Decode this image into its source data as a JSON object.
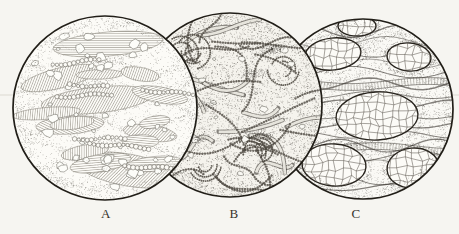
{
  "figure": {
    "kind": "micrograph-plate-illustration",
    "colors": {
      "paper": "#f6f5f1",
      "ink": "#211e18",
      "label_text": "#35322b",
      "rule_line": "#dcd9d1"
    },
    "rule_line_y": 95,
    "panels": [
      {
        "label": "A",
        "texture": "hatched-bands-with-pores",
        "cx": 105,
        "cy": 108,
        "r": 92,
        "z": 2,
        "seed": 1101,
        "label_x": 106,
        "label_y": 207
      },
      {
        "label": "B",
        "texture": "dense-swirl-cells",
        "cx": 230,
        "cy": 105,
        "r": 92,
        "z": 1,
        "seed": 2202,
        "label_x": 234,
        "label_y": 207
      },
      {
        "label": "C",
        "texture": "oval-islands-crackle",
        "cx": 363,
        "cy": 109,
        "r": 90,
        "z": 0,
        "seed": 3303,
        "label_x": 356,
        "label_y": 207,
        "ovals": [
          [
            357,
            26,
            19,
            10,
            0
          ],
          [
            333,
            54,
            28,
            16,
            -6
          ],
          [
            409,
            57,
            22,
            14,
            5
          ],
          [
            377,
            116,
            41,
            24,
            -3
          ],
          [
            334,
            165,
            32,
            21,
            4
          ],
          [
            413,
            168,
            26,
            20,
            -5
          ]
        ]
      }
    ]
  }
}
